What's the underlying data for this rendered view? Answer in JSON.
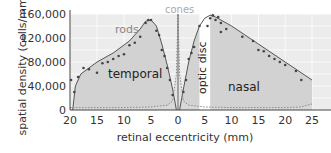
{
  "chart_data": {
    "type": "area",
    "title": "",
    "xlabel": "retinal eccentricity (mm)",
    "ylabel": "spatial density (cells/mm²)",
    "ylabel_main": "spatial density (cells/mm",
    "ylabel_sup": "2",
    "ylabel_end": ")",
    "xlim": [
      -20,
      25
    ],
    "ylim": [
      0,
      160000
    ],
    "grid": true,
    "x_ticks": [
      {
        "value": -20,
        "label": "20"
      },
      {
        "value": -15,
        "label": "15"
      },
      {
        "value": -10,
        "label": "10"
      },
      {
        "value": -5,
        "label": "5"
      },
      {
        "value": 0,
        "label": "0"
      },
      {
        "value": 5,
        "label": "5"
      },
      {
        "value": 10,
        "label": "10"
      },
      {
        "value": 15,
        "label": "15"
      },
      {
        "value": 20,
        "label": "20"
      },
      {
        "value": 25,
        "label": "25"
      }
    ],
    "y_ticks": [
      {
        "value": 0,
        "label": "0"
      },
      {
        "value": 40000,
        "label": "40,000"
      },
      {
        "value": 80000,
        "label": "80,000"
      },
      {
        "value": 120000,
        "label": "120,000"
      },
      {
        "value": 160000,
        "label": "160,000"
      }
    ],
    "annotations": {
      "rods": "rods",
      "cones": "cones",
      "temporal": "temporal",
      "nasal": "nasal",
      "optic_disc": "optic disc"
    },
    "optic_disc_range": [
      4,
      6
    ],
    "series": [
      {
        "name": "rods",
        "curve_x": [
          -19.5,
          -19,
          -18,
          -15,
          -12,
          -9,
          -7,
          -6,
          -5,
          -4,
          -3,
          -2,
          -1,
          -0.3,
          0.3,
          1,
          2,
          3,
          4,
          5,
          6,
          7,
          8,
          10,
          15,
          20,
          25
        ],
        "curve_y": [
          0,
          40000,
          60000,
          80000,
          95000,
          115000,
          135000,
          148000,
          150000,
          140000,
          110000,
          75000,
          35000,
          0,
          0,
          35000,
          80000,
          115000,
          140000,
          153000,
          158000,
          155000,
          150000,
          140000,
          110000,
          80000,
          50000
        ],
        "points_x": [
          -19.8,
          -19.2,
          -18.5,
          -17.5,
          -16.5,
          -15,
          -14,
          -13,
          -12,
          -11,
          -10,
          -9,
          -8,
          -7,
          -6,
          -5.5,
          -5,
          -4,
          -3.5,
          -3,
          -2.5,
          -2,
          -1.5,
          -1,
          1,
          1.5,
          2,
          2.5,
          3,
          4,
          5.5,
          6,
          6.5,
          7,
          7.5,
          8,
          8,
          9,
          12,
          14,
          15,
          16,
          17,
          18,
          19,
          20,
          22,
          23
        ],
        "points_y": [
          50000,
          30000,
          55000,
          70000,
          68000,
          62000,
          78000,
          80000,
          85000,
          90000,
          93000,
          108000,
          112000,
          122000,
          145000,
          150000,
          150000,
          132000,
          125000,
          100000,
          90000,
          70000,
          50000,
          25000,
          30000,
          50000,
          85000,
          95000,
          105000,
          140000,
          140000,
          153000,
          158000,
          150000,
          155000,
          145000,
          130000,
          135000,
          122000,
          115000,
          100000,
          98000,
          90000,
          85000,
          80000,
          75000,
          65000,
          50000
        ],
        "color": "#555555"
      },
      {
        "name": "cones",
        "curve_x": [
          -20,
          -15,
          -10,
          -5,
          -2,
          -1,
          -0.3,
          0,
          0.3,
          1,
          2,
          5,
          10,
          15,
          20,
          23,
          25
        ],
        "curve_y": [
          4000,
          4000,
          4000,
          5000,
          8000,
          15000,
          60000,
          160000,
          60000,
          15000,
          8000,
          5000,
          4000,
          4000,
          4000,
          5000,
          10000
        ],
        "color": "#888888"
      }
    ]
  },
  "colors": {
    "plot_bg": "#ececec",
    "fill_rods": "#d2d2d2",
    "fill_cones": "#dcdcdc",
    "grid": "#ffffff",
    "axis": "#444444",
    "text": "#333333",
    "label_gray": "#888888",
    "cones_label": "#aaaaaa"
  }
}
